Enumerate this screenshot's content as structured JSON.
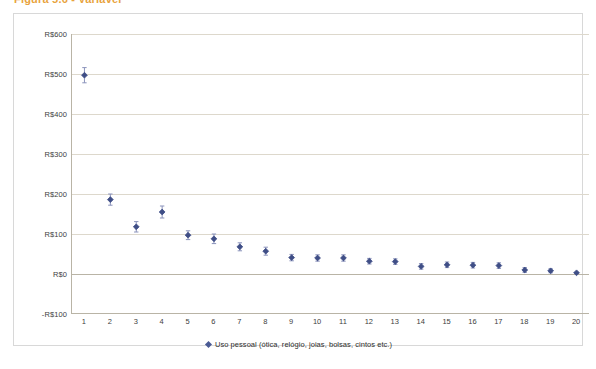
{
  "figure": {
    "title_partial": "Figura 5.6 - Variável",
    "frame_border_color": "#d8d8d8"
  },
  "legend": {
    "marker_icon": "diamond-marker-icon",
    "marker_color": "#4a5a94",
    "label": "Uso pessoal (ótica, relógio, joias, bolsas, cintos etc.)",
    "position": "bottom-center"
  },
  "chart_data": {
    "type": "scatter",
    "title": "",
    "subtitle": "",
    "xlabel": "",
    "ylabel": "",
    "grid": true,
    "series_name": "Uso pessoal (ótica, relógio, joias, bolsas, cintos etc.)",
    "marker_color": "#3f4e86",
    "errorbar_color": "#8b93bb",
    "gridline_color": "#ddd8cc",
    "x": [
      1,
      2,
      3,
      4,
      5,
      6,
      7,
      8,
      9,
      10,
      11,
      12,
      13,
      14,
      15,
      16,
      17,
      18,
      19,
      20
    ],
    "values": [
      497,
      186,
      118,
      155,
      97,
      88,
      68,
      57,
      41,
      40,
      40,
      32,
      31,
      19,
      23,
      22,
      21,
      10,
      8,
      3
    ],
    "error_low": [
      478,
      172,
      105,
      140,
      86,
      76,
      58,
      47,
      33,
      32,
      32,
      25,
      24,
      12,
      16,
      15,
      14,
      4,
      3,
      2
    ],
    "error_high": [
      516,
      200,
      131,
      170,
      108,
      100,
      78,
      67,
      49,
      48,
      48,
      39,
      38,
      26,
      30,
      29,
      28,
      16,
      13,
      4
    ],
    "xlim": [
      0.5,
      20.5
    ],
    "ylim": [
      -100,
      600
    ],
    "ytick_values": [
      600,
      500,
      400,
      300,
      200,
      100,
      0,
      -100
    ],
    "ytick_labels": [
      "R$600",
      "R$500",
      "R$400",
      "R$300",
      "R$200",
      "R$100",
      "R$0",
      "-R$100"
    ],
    "xtick_labels": [
      "1",
      "2",
      "3",
      "4",
      "5",
      "6",
      "7",
      "8",
      "9",
      "10",
      "11",
      "12",
      "13",
      "14",
      "15",
      "16",
      "17",
      "18",
      "19",
      "20"
    ],
    "currency": "R$",
    "legend_position": "bottom-center"
  }
}
